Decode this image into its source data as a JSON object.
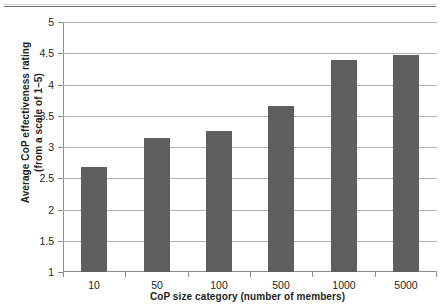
{
  "chart_data": {
    "type": "bar",
    "title": "",
    "xlabel": "CoP size category (number of members)",
    "ylabel": "Average CoP effectiveness rating (from a scale of 1–5)",
    "ylabel_line1": "Average CoP effectiveness rating",
    "ylabel_line2": "(from a scale of 1–5)",
    "categories": [
      "10",
      "50",
      "100",
      "500",
      "1000",
      "5000"
    ],
    "values": [
      2.68,
      3.15,
      3.26,
      3.66,
      4.39,
      4.48
    ],
    "ylim": [
      1,
      5
    ],
    "ytick_labels": [
      "1",
      "1.5",
      "2",
      "2.5",
      "3",
      "3.5",
      "4",
      "4.5",
      "5"
    ],
    "ytick_values": [
      1,
      1.5,
      2,
      2.5,
      3,
      3.5,
      4,
      4.5,
      5
    ],
    "grid": true,
    "legend": false,
    "legend_position": "none",
    "series": [
      {
        "name": "Average CoP effectiveness rating",
        "values": [
          2.68,
          3.15,
          3.26,
          3.66,
          4.39,
          4.48
        ]
      }
    ]
  },
  "colors": {
    "bar": "#5e5e5e",
    "gridline": "#b3b3b3",
    "axis": "#8c8c8c",
    "text": "#231f20",
    "background": "#ffffff"
  }
}
